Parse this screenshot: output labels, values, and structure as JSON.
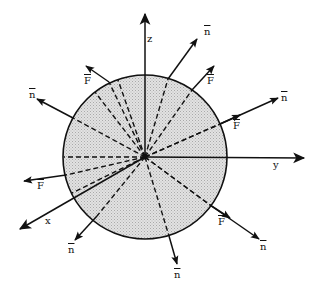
{
  "figure": {
    "sphere": {
      "cx": 145,
      "cy": 157,
      "r": 82,
      "fill": "#d8d8d8",
      "stroke": "#111111"
    },
    "axes": [
      {
        "name": "z",
        "label": "z",
        "x2": 145,
        "y2": 14,
        "lx": 147,
        "ly": 34
      },
      {
        "name": "y",
        "label": "y",
        "x2": 304,
        "y2": 158,
        "lx": 273,
        "ly": 160
      },
      {
        "name": "x",
        "label": "x",
        "x2": 20,
        "y2": 229,
        "lx": 45,
        "ly": 216
      }
    ],
    "vectors": [
      {
        "id": "n-upper-left",
        "label": "n",
        "x2": 37,
        "y2": 99,
        "edge": [
          73,
          118
        ],
        "lx": 29,
        "ly": 90
      },
      {
        "id": "F-upper-left",
        "label": "F",
        "x2": 86,
        "y2": 66,
        "edge": [
          109,
          82
        ],
        "lx": 84,
        "ly": 76
      },
      {
        "id": "n-upper-right",
        "label": "n",
        "x2": 197,
        "y2": 39,
        "edge": [
          168,
          79
        ],
        "lx": 204,
        "ly": 27
      },
      {
        "id": "F-upper-right",
        "label": "F",
        "x2": 214,
        "y2": 66,
        "edge": [
          192,
          90
        ],
        "lx": 207,
        "ly": 76
      },
      {
        "id": "n-right",
        "label": "n",
        "x2": 278,
        "y2": 98,
        "edge": [
          220,
          124
        ],
        "lx": 281,
        "ly": 93
      },
      {
        "id": "F-right",
        "label": "F",
        "x2": 240,
        "y2": 115,
        "edge": [
          220,
          124
        ],
        "lx": 233,
        "ly": 121
      },
      {
        "id": "F-left",
        "label": "F",
        "x2": 24,
        "y2": 181,
        "edge": [
          66,
          175
        ],
        "lx": 37,
        "ly": 181
      },
      {
        "id": "n-bottom-left",
        "label": "n",
        "x2": 75,
        "y2": 240,
        "edge": [
          97,
          216
        ],
        "lx": 68,
        "ly": 245
      },
      {
        "id": "n-bottom",
        "label": "n",
        "x2": 177,
        "y2": 264,
        "edge": [
          169,
          236
        ],
        "lx": 174,
        "ly": 270
      },
      {
        "id": "n-lower-right",
        "label": "n",
        "x2": 259,
        "y2": 239,
        "edge": [
          210,
          205
        ],
        "lx": 260,
        "ly": 242
      },
      {
        "id": "F-lower-right",
        "label": "F",
        "x2": 230,
        "y2": 218,
        "edge": [
          210,
          205
        ],
        "lx": 218,
        "ly": 217
      }
    ],
    "extra_dashed_rays": [
      {
        "x2": 64,
        "y2": 157
      },
      {
        "x2": 95,
        "y2": 92
      },
      {
        "x2": 118,
        "y2": 80
      },
      {
        "x2": 72,
        "y2": 193
      }
    ]
  },
  "labels": {
    "z": "z",
    "y": "y",
    "x": "x",
    "n": "n",
    "F": "F"
  }
}
